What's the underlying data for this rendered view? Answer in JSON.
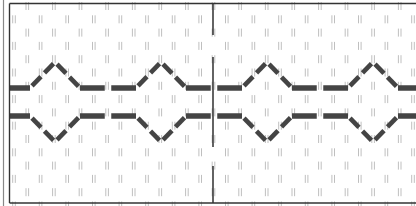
{
  "figure": {
    "type": "stitch-pattern-chart"
  },
  "colors": {
    "background": "#ffffff",
    "frame": "#333333",
    "outer_frame": "#888888",
    "grid_marks": "#b8b8b8",
    "stitch": "#444444",
    "center_line": "#222222"
  },
  "grid": {
    "col_spacing": 13.3,
    "row_spacing": 13.3,
    "origin_x": 14,
    "origin_y": 6
  },
  "pattern": {
    "period": 106,
    "peaks_x": [
      55,
      161,
      267,
      373
    ],
    "upper_line": {
      "baseline_y": 88,
      "apex_y": 62,
      "direction": "up"
    },
    "lower_line": {
      "baseline_y": 116,
      "apex_y": 142,
      "direction": "down"
    }
  },
  "center_line": {
    "x": 213,
    "segments": [
      [
        3,
        35
      ],
      [
        57,
        147
      ],
      [
        166,
        203
      ]
    ]
  }
}
